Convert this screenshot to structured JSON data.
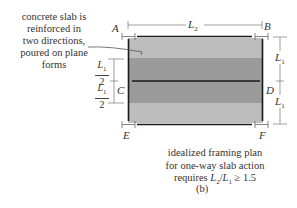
{
  "annotation": {
    "lines": [
      "concrete slab is",
      "reinforced in",
      "two directions,",
      "poured on plane",
      "forms"
    ]
  },
  "points": {
    "A": "A",
    "B": "B",
    "C": "C",
    "D": "D",
    "E": "E",
    "F": "F"
  },
  "dimensions": {
    "span": {
      "symbol": "L",
      "subscript": "2"
    },
    "right_top": {
      "symbol": "L",
      "subscript": "1"
    },
    "right_bottom": {
      "symbol": "L",
      "subscript": "1"
    },
    "left_top": {
      "symbol": "L",
      "subscript": "1",
      "denominator": "2"
    },
    "left_bottom": {
      "symbol": "L",
      "subscript": "1",
      "denominator": "2"
    }
  },
  "caption": {
    "line1": "idealized framing plan",
    "line2": "for one-way slab action",
    "line3_prefix": "requires ",
    "ratio_num": "L",
    "ratio_num_sub": "2",
    "ratio_sep": "/",
    "ratio_den": "L",
    "ratio_den_sub": "1",
    "ratio_rel": " ≥ 1.5"
  },
  "sublabel": "(b)",
  "colors": {
    "light_band": "#bdbdbd",
    "dark_band": "#9a9a9a",
    "beam": "#1a1a1a",
    "dim_line": "#777777"
  }
}
